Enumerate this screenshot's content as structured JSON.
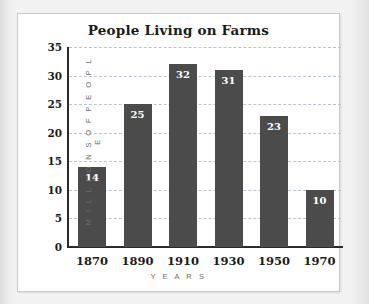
{
  "chart_data": {
    "type": "bar",
    "title": "People Living on Farms",
    "xlabel": "Y E A R S",
    "ylabel": "M I L L I O N S   O F   P E O P L E",
    "categories": [
      "1870",
      "1890",
      "1910",
      "1930",
      "1950",
      "1970"
    ],
    "values": [
      14,
      25,
      32,
      31,
      23,
      10
    ],
    "ylim": [
      0,
      35
    ],
    "ytick_labels": [
      "0",
      "5",
      "10",
      "15",
      "20",
      "25",
      "30",
      "35"
    ],
    "ytick_values": [
      0,
      5,
      10,
      15,
      20,
      25,
      30,
      35
    ],
    "grid": "horizontal-dashed",
    "legend": "none",
    "bar_color": "#4b4b4b",
    "value_label_color": "#ffffff",
    "gridline_color": "#b9c4cf",
    "axis_color": "#2b2b2b",
    "panel_background": "#ffffff",
    "page_background": "#e9e9e9"
  }
}
